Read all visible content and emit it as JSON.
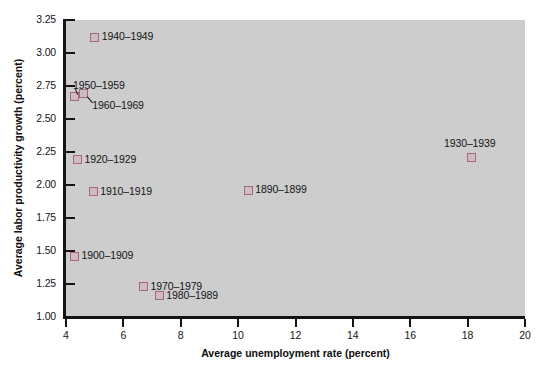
{
  "chart_data": {
    "type": "scatter",
    "title": "",
    "xlabel": "Average unemployment rate (percent)",
    "ylabel": "Average labor productivity growth (percent)",
    "xlim": [
      4,
      20
    ],
    "ylim": [
      1.0,
      3.25
    ],
    "xticks": [
      "4",
      "6",
      "8",
      "10",
      "12",
      "14",
      "16",
      "18",
      "20"
    ],
    "xtick_values": [
      4,
      6,
      8,
      10,
      12,
      14,
      16,
      18,
      20
    ],
    "yticks": [
      "1.00",
      "1.25",
      "1.50",
      "1.75",
      "2.00",
      "2.25",
      "2.50",
      "2.75",
      "3.00",
      "3.25"
    ],
    "ytick_values": [
      1.0,
      1.25,
      1.5,
      1.75,
      2.0,
      2.25,
      2.5,
      2.75,
      3.0,
      3.25
    ],
    "grid": false,
    "legend": "none",
    "marker": "open-square",
    "marker_color": "#a8657c",
    "plot_background": "#cdcdce",
    "points": [
      {
        "label": "1890–1899",
        "x": 10.35,
        "y": 1.96,
        "label_side": "right"
      },
      {
        "label": "1900–1909",
        "x": 4.3,
        "y": 1.46,
        "label_side": "right"
      },
      {
        "label": "1910–1919",
        "x": 4.95,
        "y": 1.95,
        "label_side": "right"
      },
      {
        "label": "1920–1929",
        "x": 4.4,
        "y": 2.19,
        "label_side": "right"
      },
      {
        "label": "1930–1939",
        "x": 18.15,
        "y": 2.21,
        "label_side": "above"
      },
      {
        "label": "1940–1949",
        "x": 5.0,
        "y": 3.12,
        "label_side": "right"
      },
      {
        "label": "1950–1959",
        "x": 4.28,
        "y": 2.67,
        "label_side": "above-left"
      },
      {
        "label": "1960–1969",
        "x": 4.6,
        "y": 2.69,
        "label_side": "below-right"
      },
      {
        "label": "1970–1979",
        "x": 6.7,
        "y": 1.23,
        "label_side": "right"
      },
      {
        "label": "1980–1989",
        "x": 7.25,
        "y": 1.16,
        "label_side": "right"
      }
    ]
  }
}
